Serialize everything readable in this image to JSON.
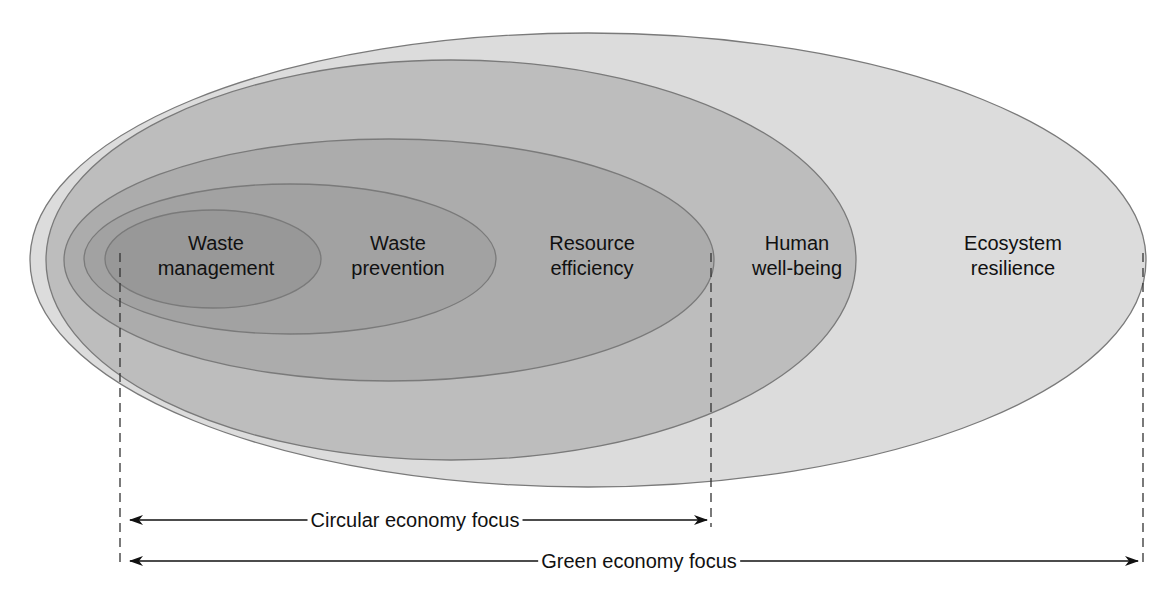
{
  "diagram": {
    "title": "",
    "colors": {
      "outline": "#7a7a7a",
      "dashed_line": "#333333",
      "arrow": "#111111",
      "text": "#111111"
    },
    "rings": [
      {
        "id": "ecosystem-resilience",
        "line1": "Ecosystem",
        "line2": "resilience",
        "fill": "#dcdcdc",
        "ellipse": {
          "cx": 588,
          "cy": 260,
          "rx": 558,
          "ry": 227
        },
        "label_pos": {
          "x": 1013,
          "y": 231
        }
      },
      {
        "id": "human-well-being",
        "line1": "Human",
        "line2": "well-being",
        "fill": "#bdbdbd",
        "ellipse": {
          "cx": 451,
          "cy": 260,
          "rx": 405,
          "ry": 200
        },
        "label_pos": {
          "x": 797,
          "y": 231
        }
      },
      {
        "id": "resource-efficiency",
        "line1": "Resource",
        "line2": "efficiency",
        "fill": "#acacac",
        "ellipse": {
          "cx": 389,
          "cy": 260,
          "rx": 325,
          "ry": 121
        },
        "label_pos": {
          "x": 592,
          "y": 231
        }
      },
      {
        "id": "waste-prevention",
        "line1": "Waste",
        "line2": "prevention",
        "fill": "#a2a2a2",
        "ellipse": {
          "cx": 290,
          "cy": 259,
          "rx": 206,
          "ry": 75
        },
        "label_pos": {
          "x": 398,
          "y": 231
        }
      },
      {
        "id": "waste-management",
        "line1": "Waste",
        "line2": "management",
        "fill": "#989898",
        "ellipse": {
          "cx": 213,
          "cy": 259,
          "rx": 108,
          "ry": 49
        },
        "label_pos": {
          "x": 216,
          "y": 231
        }
      }
    ],
    "focus_ranges": [
      {
        "id": "circular-economy-focus",
        "label": "Circular economy focus",
        "x_start": 130,
        "x_end": 707,
        "y": 520,
        "label_x": 415
      },
      {
        "id": "green-economy-focus",
        "label": "Green economy focus",
        "x_start": 130,
        "x_end": 1138,
        "y": 561,
        "label_x": 639
      }
    ],
    "dashed_guides": [
      {
        "id": "guide-left",
        "x": 120,
        "y1": 253,
        "y2": 566
      },
      {
        "id": "guide-middle",
        "x": 711,
        "y1": 253,
        "y2": 527
      },
      {
        "id": "guide-right",
        "x": 1143,
        "y1": 253,
        "y2": 568
      }
    ]
  }
}
